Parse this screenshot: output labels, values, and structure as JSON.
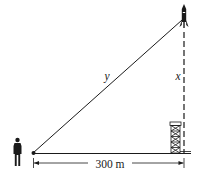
{
  "diagram": {
    "type": "related-rates-right-triangle",
    "labels": {
      "hypotenuse": "y",
      "vertical": "x",
      "horizontal_distance": "300 m"
    },
    "objects": {
      "observer": "person-icon",
      "rocket": "rocket-icon",
      "launch_tower": "launch-tower-icon"
    },
    "colors": {
      "line": "#1a1a1a",
      "background": "#ffffff"
    }
  }
}
